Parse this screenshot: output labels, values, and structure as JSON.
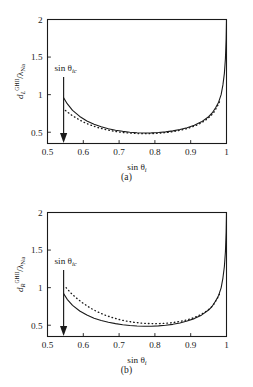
{
  "figure": {
    "panels": [
      {
        "id": "a",
        "caption": "(a)",
        "ylabel_main": "d",
        "ylabel_sub": "L",
        "ylabel_sup": "GHII",
        "ylabel_denom": "/λ",
        "ylabel_denom_sub": "Na",
        "xlabel_main": "sin θ",
        "xlabel_sub": "i",
        "annotation": {
          "text_main": "sin θ",
          "text_sub": "ic",
          "arrow_x_value": 0.545
        },
        "chart_data": {
          "type": "line",
          "title": "",
          "xlabel": "sin θ_i",
          "ylabel": "d_L^GHII / λ_Na",
          "xlim": [
            0.5,
            1.0
          ],
          "ylim": [
            0.35,
            2.0
          ],
          "xticks": [
            0.5,
            0.6,
            0.7,
            0.8,
            0.9,
            1
          ],
          "xticklabels": [
            "0.5",
            "0.6",
            "0.7",
            "0.8",
            "0.9",
            "1"
          ],
          "yticks": [
            0.5,
            1,
            1.5,
            2
          ],
          "yticklabels": [
            "0.5",
            "1",
            "1.5",
            "2"
          ],
          "grid": false,
          "legend": "none",
          "series": [
            {
              "name": "solid",
              "style": "solid",
              "x": [
                0.545,
                0.555,
                0.57,
                0.59,
                0.61,
                0.63,
                0.65,
                0.67,
                0.69,
                0.71,
                0.73,
                0.75,
                0.77,
                0.79,
                0.81,
                0.83,
                0.85,
                0.87,
                0.89,
                0.91,
                0.93,
                0.95,
                0.96,
                0.97,
                0.978,
                0.985,
                0.99,
                0.994,
                0.997,
                0.999,
                1.0
              ],
              "y": [
                0.96,
                0.88,
                0.79,
                0.71,
                0.65,
                0.605,
                0.572,
                0.547,
                0.527,
                0.512,
                0.5,
                0.493,
                0.49,
                0.491,
                0.496,
                0.505,
                0.518,
                0.536,
                0.56,
                0.592,
                0.638,
                0.706,
                0.756,
                0.83,
                0.9,
                1.0,
                1.13,
                1.28,
                1.48,
                1.74,
                2.0
              ]
            },
            {
              "name": "dotted",
              "style": "dotted",
              "x": [
                0.55,
                0.565,
                0.58,
                0.6,
                0.62,
                0.64,
                0.66,
                0.68,
                0.7,
                0.72,
                0.74,
                0.76,
                0.78,
                0.8,
                0.82,
                0.84,
                0.86,
                0.88,
                0.9,
                0.92,
                0.94,
                0.955,
                0.965,
                0.975,
                0.983
              ],
              "y": [
                0.79,
                0.735,
                0.69,
                0.636,
                0.595,
                0.563,
                0.538,
                0.518,
                0.503,
                0.492,
                0.485,
                0.481,
                0.481,
                0.484,
                0.491,
                0.501,
                0.516,
                0.536,
                0.563,
                0.6,
                0.655,
                0.712,
                0.768,
                0.85,
                0.93
              ]
            }
          ]
        }
      },
      {
        "id": "b",
        "caption": "(b)",
        "ylabel_main": "d",
        "ylabel_sub": "R",
        "ylabel_sup": "GHII",
        "ylabel_denom": "/λ",
        "ylabel_denom_sub": "Na",
        "xlabel_main": "sin θ",
        "xlabel_sub": "i",
        "annotation": {
          "text_main": "sin θ",
          "text_sub": "ic",
          "arrow_x_value": 0.545
        },
        "chart_data": {
          "type": "line",
          "title": "",
          "xlabel": "sin θ_i",
          "ylabel": "d_R^GHII / λ_Na",
          "xlim": [
            0.5,
            1.0
          ],
          "ylim": [
            0.35,
            2.0
          ],
          "xticks": [
            0.5,
            0.6,
            0.7,
            0.8,
            0.9,
            1
          ],
          "xticklabels": [
            "0.5",
            "0.6",
            "0.7",
            "0.8",
            "0.9",
            "1"
          ],
          "yticks": [
            0.5,
            1,
            1.5,
            2
          ],
          "yticklabels": [
            "0.5",
            "1",
            "1.5",
            "2"
          ],
          "grid": false,
          "legend": "none",
          "series": [
            {
              "name": "solid",
              "style": "solid",
              "x": [
                0.545,
                0.555,
                0.57,
                0.59,
                0.61,
                0.63,
                0.65,
                0.67,
                0.69,
                0.71,
                0.73,
                0.75,
                0.77,
                0.79,
                0.81,
                0.83,
                0.85,
                0.87,
                0.89,
                0.91,
                0.93,
                0.95,
                0.96,
                0.97,
                0.978,
                0.985,
                0.99,
                0.994,
                0.997,
                0.999,
                1.0
              ],
              "y": [
                0.92,
                0.845,
                0.765,
                0.69,
                0.635,
                0.594,
                0.563,
                0.539,
                0.521,
                0.507,
                0.497,
                0.49,
                0.487,
                0.487,
                0.491,
                0.499,
                0.512,
                0.53,
                0.555,
                0.588,
                0.634,
                0.702,
                0.752,
                0.826,
                0.897,
                0.998,
                1.128,
                1.278,
                1.478,
                1.738,
                2.0
              ]
            },
            {
              "name": "dotted",
              "style": "dotted",
              "x": [
                0.552,
                0.565,
                0.58,
                0.6,
                0.62,
                0.64,
                0.66,
                0.68,
                0.7,
                0.72,
                0.74,
                0.76,
                0.78,
                0.8,
                0.82,
                0.84,
                0.86,
                0.88,
                0.9,
                0.92,
                0.94,
                0.955,
                0.965,
                0.975,
                0.983
              ],
              "y": [
                1.0,
                0.93,
                0.865,
                0.79,
                0.728,
                0.677,
                0.636,
                0.603,
                0.576,
                0.555,
                0.54,
                0.529,
                0.523,
                0.521,
                0.523,
                0.53,
                0.542,
                0.56,
                0.585,
                0.621,
                0.674,
                0.728,
                0.782,
                0.862,
                0.94
              ]
            }
          ]
        }
      }
    ]
  }
}
